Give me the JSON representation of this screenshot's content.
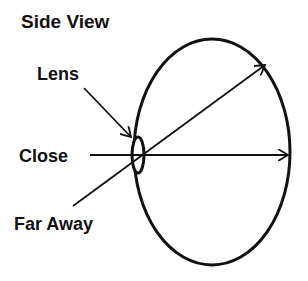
{
  "diagram": {
    "title": "Side View",
    "labels": {
      "lens": "Lens",
      "close": "Close",
      "far": "Far Away"
    },
    "colors": {
      "stroke": "#111111",
      "background": "#ffffff"
    }
  }
}
